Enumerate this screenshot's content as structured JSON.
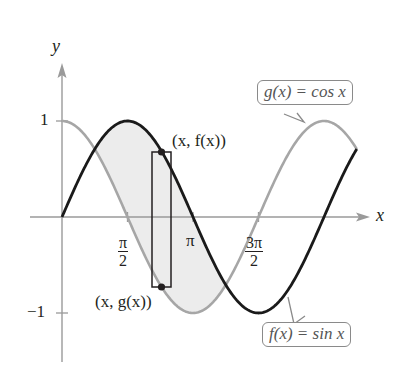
{
  "figure": {
    "axes": {
      "x_label": "x",
      "y_label": "y",
      "y_ticks": [
        {
          "value": 1,
          "label": "1"
        },
        {
          "value": -1,
          "label": "−1"
        }
      ],
      "x_ticks": [
        {
          "value": "pi/2",
          "num": "π",
          "den": "2"
        },
        {
          "value": "pi",
          "label": "π"
        },
        {
          "value": "3pi/2",
          "num": "3π",
          "den": "2"
        }
      ]
    },
    "curves": {
      "f": {
        "label": "f(x) = sin x",
        "color": "#1a1a1a"
      },
      "g": {
        "label": "g(x) = cos x",
        "color": "#a6a6a6"
      }
    },
    "points": {
      "top": "(x, f(x))",
      "bottom": "(x, g(x))"
    },
    "region_fill": "#ececec"
  },
  "chart_data": {
    "type": "line",
    "title": "",
    "xlabel": "x",
    "ylabel": "y",
    "xlim": [
      0,
      7.07
    ],
    "ylim": [
      -1,
      1
    ],
    "x_tick_labels": [
      "π/2",
      "π",
      "3π/2"
    ],
    "y_tick_labels": [
      "1",
      "−1"
    ],
    "series": [
      {
        "name": "f(x) = sin x",
        "function": "sin(x)",
        "domain": [
          0,
          7.07
        ],
        "color": "#1a1a1a"
      },
      {
        "name": "g(x) = cos x",
        "function": "cos(x)",
        "domain": [
          0,
          7.07
        ],
        "color": "#a6a6a6"
      }
    ],
    "shaded_region": {
      "between": [
        "f",
        "g"
      ],
      "x_range": [
        "π/4",
        "5π/4"
      ]
    },
    "representative_rectangle": {
      "x": 1.9,
      "top": "(x, f(x))",
      "bottom": "(x, g(x))"
    },
    "grid": false,
    "legend": "callouts"
  }
}
